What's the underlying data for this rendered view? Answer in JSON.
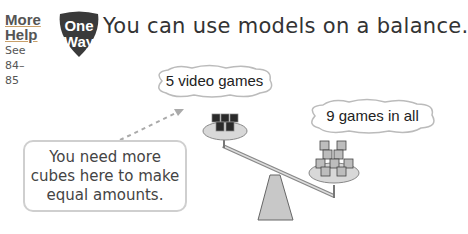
{
  "sidebar": {
    "more_help_line1": "More",
    "more_help_line2": "Help",
    "see_label": "See",
    "page_from": "84–",
    "page_to": "85"
  },
  "badge": {
    "line1": "One",
    "line2": "Way",
    "color": "#333333"
  },
  "headline": "You can use models on a balance.",
  "balance": {
    "left_label": "5 video games",
    "left_cubes": 5,
    "right_label": "9 games in all",
    "right_cubes": 9
  },
  "note": {
    "line1": "You need more",
    "line2": "cubes here to make",
    "line3": "equal amounts."
  }
}
